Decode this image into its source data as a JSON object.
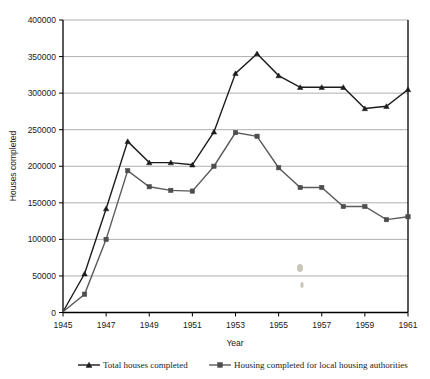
{
  "chart_data": {
    "type": "line",
    "title": "",
    "xlabel": "Year",
    "ylabel": "Houses completed",
    "xlim": [
      1945,
      1961
    ],
    "ylim": [
      0,
      400000
    ],
    "grid": true,
    "legend_position": "bottom",
    "x": [
      1945,
      1946,
      1947,
      1948,
      1949,
      1950,
      1951,
      1952,
      1953,
      1954,
      1955,
      1956,
      1957,
      1958,
      1959,
      1960,
      1961
    ],
    "xtick_labels": [
      "1945",
      "1947",
      "1949",
      "1951",
      "1953",
      "1955",
      "1957",
      "1959",
      "1961"
    ],
    "xticks": [
      1945,
      1947,
      1949,
      1951,
      1953,
      1955,
      1957,
      1959,
      1961
    ],
    "ytick_labels": [
      "0",
      "50000",
      "100000",
      "150000",
      "200000",
      "250000",
      "300000",
      "350000",
      "400000"
    ],
    "yticks": [
      0,
      50000,
      100000,
      150000,
      200000,
      250000,
      300000,
      350000,
      400000
    ],
    "series": [
      {
        "name": "Total houses completed",
        "marker": "triangle",
        "color": "#1c1c1c",
        "values": [
          1000,
          53000,
          142000,
          234000,
          205000,
          205000,
          202000,
          247000,
          327000,
          354000,
          324000,
          308000,
          308000,
          308000,
          279000,
          282000,
          305000
        ]
      },
      {
        "name": "Housing completed for local housing authorities",
        "marker": "square",
        "color": "#4d4d4d",
        "values": [
          1000,
          25000,
          100000,
          194000,
          172000,
          167000,
          166000,
          200000,
          246000,
          241000,
          198000,
          171000,
          171000,
          145000,
          145000,
          127000,
          131000
        ]
      }
    ]
  },
  "legend": {
    "entries": [
      {
        "label": "Total houses completed",
        "marker": "triangle"
      },
      {
        "label": "Housing completed for local housing authorities",
        "marker": "square"
      }
    ]
  }
}
